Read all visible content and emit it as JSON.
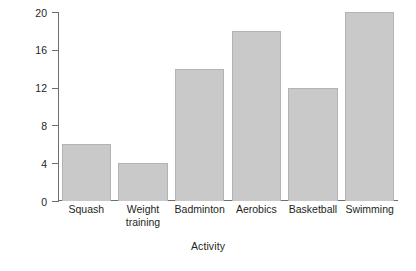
{
  "chart_data": {
    "type": "bar",
    "title": "",
    "subtitle": "",
    "xlabel": "Activity",
    "ylabel": "Frequency",
    "categories": [
      "Squash",
      "Weight training",
      "Badminton",
      "Aerobics",
      "Basketball",
      "Swimming"
    ],
    "category_lines": [
      [
        "Squash"
      ],
      [
        "Weight",
        "training"
      ],
      [
        "Badminton"
      ],
      [
        "Aerobics"
      ],
      [
        "Basketball"
      ],
      [
        "Swimming"
      ]
    ],
    "values": [
      6,
      4,
      14,
      18,
      12,
      20
    ],
    "ylim": [
      0,
      20
    ],
    "yticks": [
      0,
      4,
      8,
      12,
      16,
      20
    ],
    "ytick_labels": [
      "0",
      "4",
      "8",
      "12",
      "16",
      "20"
    ],
    "grid": false,
    "legend": false,
    "legend_position": "none",
    "bar_fill_color": "#c9c9c9",
    "bar_edge_color": "#b3b3b3",
    "axis_color": "#6e6e6e",
    "text_color": "#231f20",
    "background_color": "#ffffff"
  }
}
